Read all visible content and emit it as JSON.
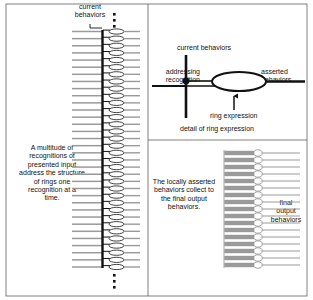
{
  "figure": {
    "title_caption": "detail of ring expression",
    "background": "#ffffff",
    "ink": "#1a1a1a"
  },
  "left_panel": {
    "name": "multitude-of-recognitions-column",
    "top_label": "current\nbehaviors",
    "body_text": "A multitude of\nrecognitions of\npresented input\naddress the structure\nof rings one\nrecognition at a\ntime.",
    "ellipsis_top": "three-vertical-dots",
    "ellipsis_bottom": "three-vertical-dots",
    "ring_rows": 34,
    "bar_color": "#9a9a9a",
    "spine_color": "#111111"
  },
  "detail_panel": {
    "name": "detail-of-ring-expression",
    "label_current_behaviors": "current behaviors",
    "label_addressing_recognition": "addressing\nrecognition",
    "label_asserted_behaviors": "asserted\nbehaviors",
    "label_ring_expression": "ring expression",
    "caption": "detail of ring expression",
    "arrow": "up-arrow-to-ring",
    "junction": "filled-dot-junction"
  },
  "output_panel": {
    "name": "final-output-behaviors-panel",
    "body_text": "The locally asserted\nbehaviors collect to\nthe final output\nbehaviors.",
    "right_label": "final\noutput\nbehaviors",
    "ring_rows": 17,
    "bar_color": "#9a9a9a"
  }
}
